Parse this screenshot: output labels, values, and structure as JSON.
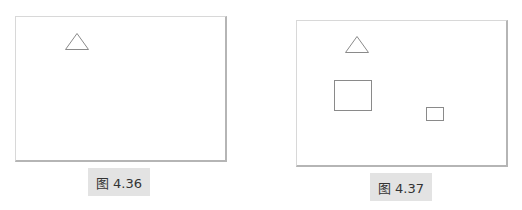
{
  "figures": [
    {
      "caption": "图 4.36",
      "shapes": [
        {
          "type": "triangle"
        }
      ]
    },
    {
      "caption": "图 4.37",
      "shapes": [
        {
          "type": "triangle"
        },
        {
          "type": "rectangle",
          "size": "large"
        },
        {
          "type": "rectangle",
          "size": "small"
        }
      ]
    }
  ],
  "colors": {
    "stroke": "#8a8a8a",
    "caption_bg": "#e3e3e3"
  }
}
